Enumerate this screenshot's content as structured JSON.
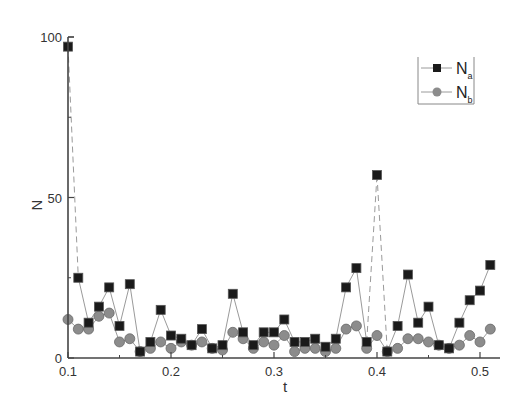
{
  "chart_data": {
    "type": "line",
    "title": "",
    "xlabel": "t",
    "ylabel": "N",
    "xlim": [
      0.1,
      0.517
    ],
    "ylim": [
      0,
      100
    ],
    "x_ticks": [
      "0.1",
      "0.2",
      "0.3",
      "0.4",
      "0.5"
    ],
    "y_ticks": [
      "0",
      "50",
      "100"
    ],
    "grid": false,
    "legend_position": "upper right",
    "x": [
      0.1,
      0.11,
      0.12,
      0.13,
      0.14,
      0.15,
      0.16,
      0.17,
      0.18,
      0.19,
      0.2,
      0.21,
      0.22,
      0.23,
      0.24,
      0.25,
      0.26,
      0.27,
      0.28,
      0.29,
      0.3,
      0.31,
      0.32,
      0.33,
      0.34,
      0.35,
      0.36,
      0.37,
      0.38,
      0.39,
      0.4,
      0.41,
      0.42,
      0.43,
      0.44,
      0.45,
      0.46,
      0.47,
      0.48,
      0.49,
      0.5,
      0.51
    ],
    "series": [
      {
        "name": "N_a",
        "label_main": "N",
        "label_sub": "a",
        "marker": "square",
        "color": "#1a1a1a",
        "values": [
          97,
          25,
          11,
          16,
          22,
          10,
          23,
          2,
          5,
          15,
          7,
          6,
          4,
          9,
          3,
          4,
          20,
          8,
          4,
          8,
          8,
          12,
          5,
          5,
          6,
          3.5,
          6,
          22,
          28,
          5,
          57,
          2,
          10,
          26,
          11,
          16,
          4,
          3,
          11,
          18,
          21,
          29
        ]
      },
      {
        "name": "N_b",
        "label_main": "N",
        "label_sub": "b",
        "marker": "circle",
        "color": "#8c8c8c",
        "values": [
          12,
          9,
          9,
          13,
          14,
          5,
          6,
          2,
          3,
          5,
          3,
          5,
          4,
          5,
          3,
          2.5,
          8,
          6,
          3,
          5,
          4,
          7,
          2,
          3,
          3,
          2,
          3,
          9,
          10,
          3,
          7,
          2,
          3,
          6,
          6,
          5,
          4,
          3,
          4,
          7,
          5,
          9
        ]
      }
    ],
    "dashed_segments": [
      [
        0,
        1
      ],
      [
        29,
        30
      ],
      [
        30,
        31
      ]
    ]
  }
}
